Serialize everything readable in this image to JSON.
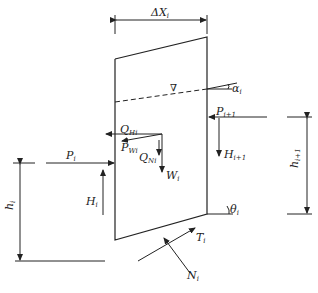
{
  "diagram": {
    "labels": {
      "delta_x": {
        "main": "ΔX",
        "sub": "i"
      },
      "alpha": {
        "main": "α",
        "sub": "i"
      },
      "water_symbol": "∇",
      "p_next": {
        "main": "P",
        "sub": "i+1"
      },
      "q_h": {
        "main": "Q",
        "sub": "Hi"
      },
      "p_w": {
        "main": "P",
        "sub": "Wi"
      },
      "q_n": {
        "main": "Q",
        "sub": "Ni"
      },
      "w": {
        "main": "W",
        "sub": "i"
      },
      "h_next_force": {
        "main": "H",
        "sub": "i+1"
      },
      "p_i": {
        "main": "P",
        "sub": "i"
      },
      "h_i_force": {
        "main": "H",
        "sub": "i"
      },
      "h_i_dim": {
        "main": "h",
        "sub": "i"
      },
      "h_next_dim": {
        "main": "h",
        "sub": "i+1"
      },
      "theta": {
        "main": "θ",
        "sub": "i"
      },
      "t": {
        "main": "T",
        "sub": "i"
      },
      "n": {
        "main": "N",
        "sub": "i"
      }
    },
    "colors": {
      "line": "#222222",
      "background": "#ffffff"
    }
  }
}
